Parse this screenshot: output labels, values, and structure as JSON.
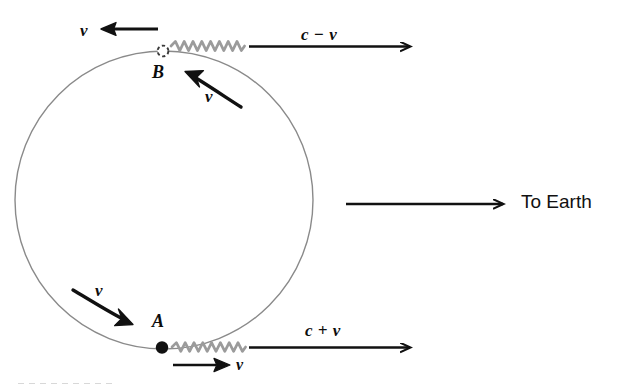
{
  "figure": {
    "background_color": "#ffffff",
    "ink_color": "#111111",
    "orbit_color": "#8a8a8a",
    "wave_color": "#999999"
  },
  "orbit": {
    "name": "circular-orbit-path",
    "center_x": 164,
    "center_y": 200,
    "radius": 149,
    "stroke_color": "#8a8a8a",
    "stroke_width": 1.4
  },
  "points": [
    {
      "id": "B",
      "label": "B",
      "marker": "hollow-dashed-circle",
      "x": 163,
      "y": 51,
      "description": "source at top of orbit, receding"
    },
    {
      "id": "A",
      "label": "A",
      "marker": "filled-dot",
      "x": 162,
      "y": 348,
      "description": "source at bottom of orbit, approaching"
    }
  ],
  "waves": [
    {
      "name": "light-wave-top",
      "from_point": "B",
      "x_start": 172,
      "x_end": 243,
      "y": 46,
      "color": "#999999"
    },
    {
      "name": "light-wave-bottom",
      "from_point": "A",
      "x_start": 173,
      "x_end": 243,
      "y": 347,
      "color": "#999999"
    }
  ],
  "arrows": [
    {
      "name": "speed-arrow-top",
      "label": "c − v",
      "direction": "right",
      "x_start": 248,
      "x_end": 422,
      "y": 46
    },
    {
      "name": "speed-arrow-bottom",
      "label": "c + v",
      "direction": "right",
      "x_start": 248,
      "x_end": 422,
      "y": 347
    },
    {
      "name": "velocity-arrow-top-left",
      "label": "v",
      "direction": "left",
      "x_start": 158,
      "x_end": 102,
      "y": 29
    },
    {
      "name": "velocity-arrow-bottom",
      "label": "v",
      "direction": "right",
      "x_start": 172,
      "x_end": 229,
      "y": 365
    },
    {
      "name": "tangential-velocity-arrow-upper",
      "label": "v",
      "direction": "up-left-curved",
      "x_start": 240,
      "y_start": 105,
      "x_end": 186,
      "y_end": 72
    },
    {
      "name": "tangential-velocity-arrow-lower",
      "label": "v",
      "direction": "down-right-curved",
      "x_start": 72,
      "y_start": 289,
      "x_end": 130,
      "y_end": 323
    },
    {
      "name": "to-earth-arrow",
      "label": "To Earth",
      "direction": "right",
      "x_start": 345,
      "x_end": 512,
      "y": 204
    }
  ],
  "labels": {
    "v_top_left": "v",
    "c_minus_v": "c − v",
    "v_upper_curve": "v",
    "point_b": "B",
    "point_a": "A",
    "v_lower_curve": "v",
    "c_plus_v": "c + v",
    "v_bottom": "v",
    "to_earth": "To Earth"
  }
}
